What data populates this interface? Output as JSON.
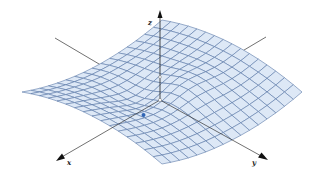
{
  "figure": {
    "axes": {
      "x": {
        "label": "x"
      },
      "y": {
        "label": "y"
      },
      "z": {
        "label": "z"
      }
    },
    "colors": {
      "surface_fill": "#dde8f6",
      "mesh_line": "#5a78a8",
      "axis_line": "#333333",
      "point": "#2f64b4"
    },
    "mesh": {
      "rows": 16,
      "cols": 16
    },
    "marked_point": {
      "label": ""
    }
  }
}
